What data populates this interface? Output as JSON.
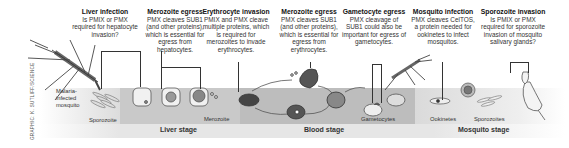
{
  "callouts": [
    {
      "title": "Liver infection",
      "text": "Is PMIX or PMX required for hepatocyte invasion?"
    },
    {
      "title": "Merozoite egress",
      "text": "PMX cleaves SUB1 (and other proteins), which is essential for egress from hepatocytes."
    },
    {
      "title": "Erythrocyte invasion",
      "text": "PMIX and PMX cleave multiple proteins, which is required for merozoites to invade erythrocytes."
    },
    {
      "title": "Merozoite egress",
      "text": "PMX cleaves SUB1 (and other proteins), which is essential for egress from erythrocytes."
    },
    {
      "title": "Gametocyte egress",
      "text": "PMX cleavage of SUB1 could also be important for egress of gametocytes."
    },
    {
      "title": "Mosquito infection",
      "text": "PMX cleaves CelTOS, a protein needed for ookinetes to infect mosquitos."
    },
    {
      "title": "Sporozoite invasion",
      "text": "Is PMIX or PMX required for sporozoite invasion of mosquito salivary glands?"
    }
  ],
  "labels": {
    "mosquito": "Malaria-infected mosquito",
    "sporozoite": "Sporozoite",
    "merozoite": "Merozoite",
    "gametocytes": "Gametocytes",
    "ookinetes": "Ookinetes",
    "sporozoites": "Sporozoites"
  },
  "stages": {
    "liver": "Liver stage",
    "blood": "Blood stage",
    "mosquito": "Mosquito stage"
  },
  "credit": "GRAPHIC: K. SUTLIFF/SCIENCE"
}
